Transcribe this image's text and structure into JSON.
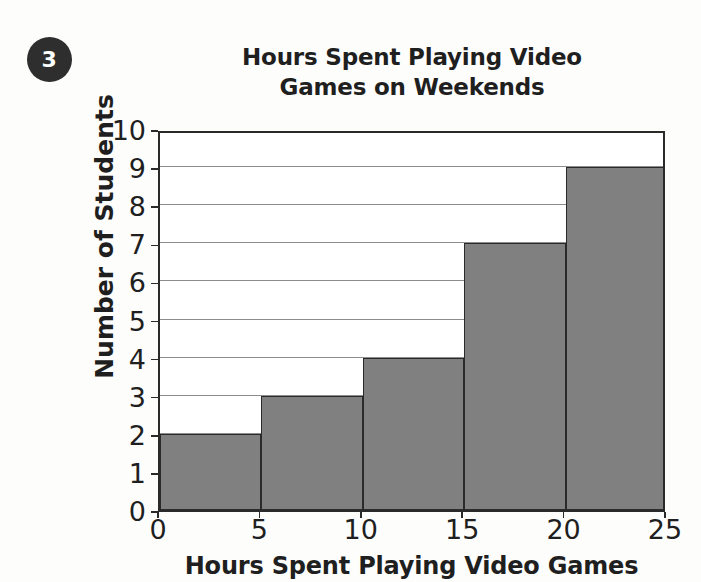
{
  "question": {
    "number": "3"
  },
  "chart_data": {
    "type": "bar",
    "title": "Hours Spent Playing Video Games on Weekends",
    "title_line1": "Hours Spent Playing Video",
    "title_line2": "Games on Weekends",
    "xlabel": "Hours Spent Playing Video Games",
    "ylabel": "Number of Students",
    "histogram": true,
    "bin_edges": [
      0,
      5,
      10,
      15,
      20,
      25
    ],
    "categories": [
      "0-5",
      "5-10",
      "10-15",
      "15-20",
      "20-25"
    ],
    "values": [
      2,
      3,
      4,
      7,
      9
    ],
    "x_tick_labels": [
      "0",
      "5",
      "10",
      "15",
      "20",
      "25"
    ],
    "y_tick_labels": [
      "0",
      "1",
      "2",
      "3",
      "4",
      "5",
      "6",
      "7",
      "8",
      "9",
      "10"
    ],
    "xlim": [
      0,
      25
    ],
    "ylim": [
      0,
      10
    ],
    "grid": true,
    "grid_axis": "y",
    "legend": false,
    "bar_color": "#808080",
    "bar_edge_color": "#2a2a2a",
    "grid_color": "#8d8d8d",
    "axis_color": "#2a2a2a",
    "background_color": "#fdfdfc"
  }
}
